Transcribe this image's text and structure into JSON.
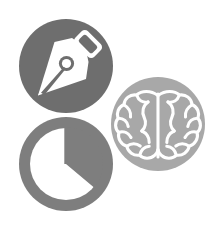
{
  "canvas": {
    "width": 215,
    "height": 230,
    "background": "#ffffff",
    "title": "Creative Design Intelligence Icon Set"
  },
  "palette": {
    "pen_circle_fill": "#6e6e6e",
    "pie_circle_fill": "#7e7e7e",
    "brain_circle_fill": "#a8a8a8",
    "glyph_fill": "#ffffff",
    "background": "#ffffff"
  },
  "badges": [
    {
      "id": "pen",
      "name": "pen-nib-badge",
      "label": "Pen Nib",
      "icon": "pen-nib-icon",
      "fill": "#6e6e6e",
      "cx": 66,
      "cy": 66,
      "r": 47,
      "z": 1
    },
    {
      "id": "pie",
      "name": "pie-chart-badge",
      "label": "Pie Chart",
      "icon": "pie-chart-icon",
      "fill": "#7e7e7e",
      "cx": 66,
      "cy": 164,
      "r": 47,
      "z": 2
    },
    {
      "id": "brain",
      "name": "brain-badge",
      "label": "Brain",
      "icon": "brain-icon",
      "fill": "#a8a8a8",
      "cx": 158,
      "cy": 124,
      "r": 47,
      "z": 3
    }
  ],
  "pie_chart": {
    "type": "pie",
    "title": "Pie Chart",
    "categories": [
      "Slice A",
      "Slice B"
    ],
    "values": [
      36,
      64
    ],
    "start_angle_deg": 0,
    "slice_span_deg": 130,
    "ring": true,
    "ring_outer_radius": 47,
    "ring_inner_radius": 36,
    "legend": "none",
    "grid": false
  },
  "pen_nib": {
    "parts": [
      "nib-blade",
      "nib-vent-hole",
      "nib-grip"
    ],
    "grip_angle_deg": 45,
    "tip_direction": "lower-left"
  },
  "brain_glyph": {
    "view": "top-down",
    "hemispheres": 2,
    "fissure": "central-vertical",
    "stroke_style": "outline"
  }
}
